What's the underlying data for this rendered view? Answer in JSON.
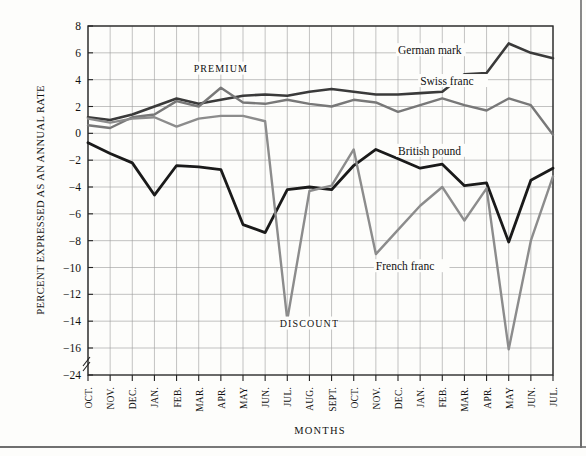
{
  "chart_data": {
    "type": "line",
    "title": "",
    "xlabel": "MONTHS",
    "ylabel": "PERCENT EXPRESSED AS AN ANNUAL RATE",
    "ylim": [
      -24,
      8
    ],
    "grid": true,
    "legend_position": "inline-annotations",
    "zone_labels": [
      {
        "text": "PREMIUM",
        "x_month": "APR.",
        "value": 4.6
      },
      {
        "text": "DISCOUNT",
        "x_month": "AUG.",
        "value": -14.4
      }
    ],
    "yticks": [
      8,
      6,
      4,
      2,
      0,
      -2,
      -4,
      -6,
      -8,
      -10,
      -12,
      -14,
      -16,
      -24
    ],
    "y_axis_break": true,
    "y_break_between": [
      -16,
      -24
    ],
    "categories": [
      "OCT.",
      "NOV.",
      "DEC.",
      "JAN.",
      "FEB.",
      "MAR.",
      "APR.",
      "MAY",
      "JUN.",
      "JUL.",
      "AUG.",
      "SEPT.",
      "OCT.",
      "NOV.",
      "DEC.",
      "JAN.",
      "FEB.",
      "MAR.",
      "APR.",
      "MAY",
      "JUN.",
      "JUL."
    ],
    "series": [
      {
        "name": "German mark",
        "color": "#3a3a3a",
        "width": 2.6,
        "label_at": {
          "category_index": 14,
          "value": 5.9
        },
        "values": [
          1.2,
          1.0,
          1.4,
          2.0,
          2.6,
          2.2,
          2.5,
          2.8,
          2.9,
          2.8,
          3.1,
          3.3,
          3.1,
          2.9,
          2.9,
          3.0,
          3.1,
          4.4,
          4.5,
          6.7,
          6.0,
          5.6
        ]
      },
      {
        "name": "Swiss franc",
        "color": "#787878",
        "width": 2.4,
        "label_at": {
          "category_index": 15,
          "value": 3.6
        },
        "values": [
          0.6,
          0.4,
          1.2,
          1.4,
          2.4,
          2.0,
          3.4,
          2.3,
          2.2,
          2.5,
          2.2,
          2.0,
          2.5,
          2.3,
          1.6,
          2.1,
          2.6,
          2.1,
          1.7,
          2.6,
          2.1,
          -0.1
        ]
      },
      {
        "name": "British pound",
        "color": "#1a1a1a",
        "width": 2.8,
        "label_at": {
          "category_index": 14,
          "value": -1.6
        },
        "values": [
          -0.7,
          -1.5,
          -2.2,
          -4.6,
          -2.4,
          -2.5,
          -2.7,
          -6.8,
          -7.4,
          -4.2,
          -4.0,
          -4.2,
          -2.4,
          -1.2,
          -1.9,
          -2.6,
          -2.3,
          -3.9,
          -3.7,
          -8.1,
          -3.5,
          -2.6
        ]
      },
      {
        "name": "French franc",
        "color": "#8c8c8c",
        "width": 2.4,
        "label_at": {
          "category_index": 13,
          "value": -10.2
        },
        "values": [
          1.1,
          0.8,
          1.1,
          1.2,
          0.5,
          1.1,
          1.3,
          1.3,
          0.9,
          -13.9,
          -4.3,
          -3.9,
          -1.2,
          -9.0,
          -7.2,
          -5.4,
          -4.0,
          -6.5,
          -4.1,
          -16.4,
          -8.0,
          -3.2
        ]
      }
    ]
  }
}
